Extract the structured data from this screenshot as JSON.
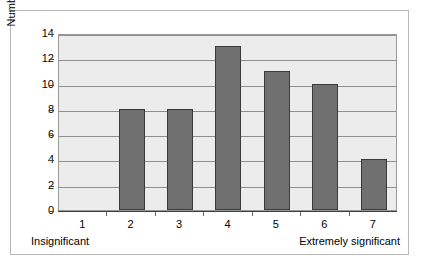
{
  "chart_data": {
    "type": "bar",
    "title": "",
    "subtitle": "",
    "xlabel": "",
    "ylabel": "Number of responses",
    "categories": [
      "1",
      "2",
      "3",
      "4",
      "5",
      "6",
      "7"
    ],
    "values": [
      0,
      8,
      8,
      13,
      11,
      10,
      4
    ],
    "ylim": [
      0,
      14
    ],
    "ytick_labels": [
      "0",
      "2",
      "4",
      "6",
      "8",
      "10",
      "12",
      "14"
    ],
    "ytick_values": [
      0,
      2,
      4,
      6,
      8,
      10,
      12,
      14
    ],
    "grid": "horizontal",
    "legend": "none",
    "annotations": {
      "x_axis_left_anchor": "Insignificant",
      "x_axis_right_anchor": "Extremely significant"
    },
    "colors": {
      "bar_fill": "#707070",
      "bar_edge": "#3a3a3a",
      "plot_background": "#ececec",
      "gridline": "#8e8e8e",
      "axis_line": "#3d3d3d",
      "frame_border": "#b9b9b9",
      "figure_background": "#ffffff",
      "text": "#000000"
    }
  }
}
